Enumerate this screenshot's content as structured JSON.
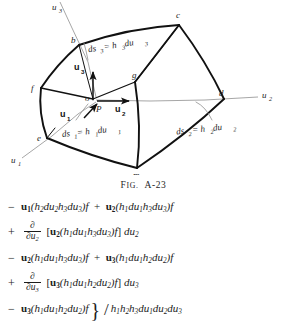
{
  "figure": {
    "caption_lead": "F",
    "caption_rest": "IG.",
    "caption_number": "A-23",
    "vertices": [
      {
        "id": "b",
        "label": "b",
        "x": 79,
        "y": 45
      },
      {
        "id": "c",
        "label": "c",
        "x": 179,
        "y": 25
      },
      {
        "id": "f",
        "label": "f",
        "x": 41,
        "y": 88
      },
      {
        "id": "g",
        "label": "g",
        "x": 135,
        "y": 82
      },
      {
        "id": "d",
        "label": "d",
        "x": 224,
        "y": 99
      },
      {
        "id": "e",
        "label": "e",
        "x": 47,
        "y": 138
      },
      {
        "id": "m",
        "label": "m",
        "x": 137,
        "y": 168
      },
      {
        "id": "o",
        "label": "o",
        "x": 93,
        "y": 99
      },
      {
        "id": "P",
        "label": "P",
        "x": 101,
        "y": 106
      }
    ],
    "axes": [
      {
        "id": "u3-axis",
        "label": "u",
        "sub": "3"
      },
      {
        "id": "u2-axis",
        "label": "u",
        "sub": "2"
      },
      {
        "id": "u1-axis",
        "label": "u",
        "sub": "1"
      }
    ],
    "unit_vectors": [
      {
        "id": "u1",
        "label": "u",
        "sub": "1"
      },
      {
        "id": "u2",
        "label": "u",
        "sub": "2"
      },
      {
        "id": "u3",
        "label": "u",
        "sub": "3"
      }
    ],
    "arc_labels": [
      {
        "id": "ds3",
        "text_parts": [
          "ds",
          "3",
          " = h",
          "3",
          " du",
          "3"
        ]
      },
      {
        "id": "ds1",
        "text_parts": [
          "ds",
          "1",
          " = h",
          "1",
          " du",
          "1"
        ]
      },
      {
        "id": "ds2",
        "text_parts": [
          "ds",
          "2",
          " = h",
          "2",
          " du",
          "2"
        ]
      }
    ]
  },
  "equations": {
    "lines": [
      {
        "id": "line-1",
        "operator": "−",
        "terms": "u1(h2du2h3du3)f + u2(h1du1h3du3)f"
      },
      {
        "id": "line-2",
        "operator": "+",
        "terms": "∂/∂u2 [u2(h1du1h3du3)f] du2"
      },
      {
        "id": "line-3",
        "operator": "−",
        "terms": "u2(h1du1h3du3)f + u3(h1du1h2du2)f"
      },
      {
        "id": "line-4",
        "operator": "+",
        "terms": "∂/∂u3 [u3(h1du1h2du2)f] du3"
      },
      {
        "id": "line-5",
        "operator": "−",
        "terms": "u3(h1du1h2du2)f } / h1h2h3du1du2du3"
      }
    ],
    "ops": {
      "minus": "−",
      "plus": "+"
    },
    "symbols": {
      "partial": "∂",
      "brace_right": "}",
      "slash": "/",
      "bracket_left": "[",
      "bracket_right": "]",
      "paren_left": "(",
      "paren_right": ")",
      "u_letter": "u",
      "h_letter": "h",
      "d_letter": "d",
      "f_letter": "f"
    }
  },
  "colors": {
    "ink": "#1c1c1c",
    "light_line": "#8a8a8a",
    "background": "#ffffff"
  }
}
